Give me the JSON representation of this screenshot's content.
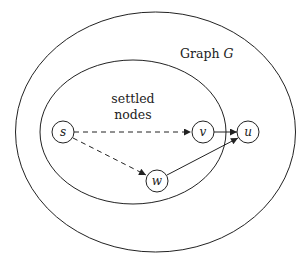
{
  "diagram": {
    "title": "Graph",
    "title_var": "G",
    "region_label_line1": "settled",
    "region_label_line2": "nodes",
    "colors": {
      "stroke": "#222222",
      "background": "#ffffff"
    },
    "regions": [
      {
        "id": "graph",
        "label": "Graph G",
        "cx": 155.5,
        "cy": 132,
        "rx": 140,
        "ry": 120
      },
      {
        "id": "settled",
        "label": "settled nodes",
        "cx": 133,
        "cy": 132,
        "rx": 93,
        "ry": 72
      }
    ],
    "nodes": [
      {
        "id": "s",
        "label": "s",
        "x": 63,
        "y": 132
      },
      {
        "id": "v",
        "label": "v",
        "x": 203,
        "y": 132
      },
      {
        "id": "u",
        "label": "u",
        "x": 248,
        "y": 132
      },
      {
        "id": "w",
        "label": "w",
        "x": 157,
        "y": 181
      }
    ],
    "edges": [
      {
        "from": "s",
        "to": "v",
        "style": "dashed"
      },
      {
        "from": "s",
        "to": "w",
        "style": "dashed"
      },
      {
        "from": "v",
        "to": "u",
        "style": "solid"
      },
      {
        "from": "w",
        "to": "u",
        "style": "solid"
      }
    ]
  }
}
